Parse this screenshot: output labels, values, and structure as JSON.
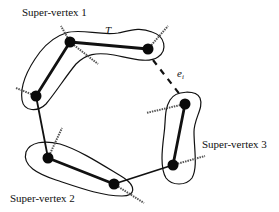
{
  "diagram": {
    "labels": {
      "sv1": "Super-vertex 1",
      "sv2": "Super-vertex 2",
      "sv3": "Super-vertex 3",
      "tree": "T",
      "edge": "e",
      "edge_sub": "i"
    },
    "nodes": [
      {
        "id": "A",
        "x": 70,
        "y": 42,
        "group": "sv1"
      },
      {
        "id": "B",
        "x": 36,
        "y": 96,
        "group": "sv1"
      },
      {
        "id": "C",
        "x": 148,
        "y": 49,
        "group": "sv1"
      },
      {
        "id": "D",
        "x": 48,
        "y": 158,
        "group": "sv2"
      },
      {
        "id": "E",
        "x": 114,
        "y": 184,
        "group": "sv2"
      },
      {
        "id": "F",
        "x": 185,
        "y": 104,
        "group": "sv3"
      },
      {
        "id": "G",
        "x": 173,
        "y": 165,
        "group": "sv3"
      }
    ],
    "edges": [
      {
        "from": "A",
        "to": "B",
        "style": "thick"
      },
      {
        "from": "A",
        "to": "C",
        "style": "thick"
      },
      {
        "from": "B",
        "to": "D",
        "style": "solid"
      },
      {
        "from": "D",
        "to": "E",
        "style": "thick"
      },
      {
        "from": "E",
        "to": "G",
        "style": "solid"
      },
      {
        "from": "G",
        "to": "F",
        "style": "thick"
      },
      {
        "from": "C",
        "to": "F",
        "style": "dashed",
        "label": "e_i"
      }
    ],
    "colors": {
      "stroke": "#111111",
      "node": "#0a0a0a",
      "stub": "#555555"
    }
  }
}
